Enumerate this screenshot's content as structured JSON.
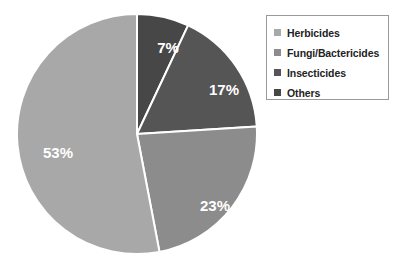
{
  "chart_data": {
    "type": "pie",
    "title": "",
    "subtitle": "",
    "xlabel": "",
    "ylabel": "",
    "grid": false,
    "legend_position": "top-right",
    "start_angle_deg": 0,
    "direction": "clockwise",
    "value_unit": "%",
    "categories": [
      "Herbicides",
      "Fungi/Bactericides",
      "Insecticides",
      "Others"
    ],
    "values": [
      53,
      23,
      17,
      7
    ],
    "labels": [
      "53%",
      "23%",
      "17%",
      "7%"
    ],
    "colors": [
      "#a8a8a8",
      "#8c8c8c",
      "#555555",
      "#474747"
    ],
    "slices": [
      {
        "label": "Others",
        "value": 7,
        "value_label": "7%",
        "color": "#474747",
        "start_angle_deg": 0,
        "end_angle_deg": 25.2,
        "label_x": 152,
        "label_y": 36
      },
      {
        "label": "Insecticides",
        "value": 17,
        "value_label": "17%",
        "color": "#555555",
        "start_angle_deg": 25.2,
        "end_angle_deg": 86.4,
        "label_x": 208,
        "label_y": 78
      },
      {
        "label": "Fungi/Bactericides",
        "value": 23,
        "value_label": "23%",
        "color": "#8c8c8c",
        "start_angle_deg": 86.4,
        "end_angle_deg": 169.2,
        "label_x": 199,
        "label_y": 194
      },
      {
        "label": "Herbicides",
        "value": 53,
        "value_label": "53%",
        "color": "#a8a8a8",
        "start_angle_deg": 169.2,
        "end_angle_deg": 360,
        "label_x": 42,
        "label_y": 141
      }
    ],
    "geometry": {
      "center_x": 121,
      "center_y": 121,
      "radius": 120,
      "separator_color": "#ffffff",
      "separator_width": 2
    }
  },
  "legend": {
    "border_color": "#9a9a9a",
    "items": [
      {
        "label": "Herbicides",
        "color": "#a8a8a8"
      },
      {
        "label": "Fungi/Bactericides",
        "color": "#8c8c8c"
      },
      {
        "label": "Insecticides",
        "color": "#555555"
      },
      {
        "label": "Others",
        "color": "#474747"
      }
    ]
  }
}
